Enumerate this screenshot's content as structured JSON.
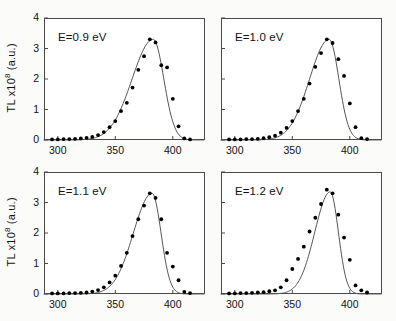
{
  "figure": {
    "background": "#fbfbfa",
    "panel_background": "#ffffff",
    "frame_color": "#4a4a4a",
    "marker_color": "#000000",
    "curve_color": "#555555",
    "ylabel_prefix": "TL x10",
    "ylabel_exponent": "8",
    "ylabel_suffix": " (a.u.)"
  },
  "chart_data": [
    {
      "type": "scatter",
      "panel": "top-left",
      "title": "",
      "annotation": "E=0.9 eV",
      "xlabel": "",
      "ylabel": "TL x10^8 (a.u.)",
      "xlim": [
        288,
        428
      ],
      "ylim": [
        0,
        4
      ],
      "xticks": [
        300,
        350,
        400
      ],
      "yticks": [
        0,
        1,
        2,
        3,
        4
      ],
      "grid": false,
      "legend": "none",
      "x": [
        295,
        300,
        305,
        310,
        315,
        320,
        325,
        330,
        335,
        340,
        345,
        350,
        355,
        360,
        365,
        370,
        375,
        380,
        385,
        390,
        395,
        400,
        405,
        410,
        415
      ],
      "values": [
        0.02,
        0.02,
        0.03,
        0.03,
        0.04,
        0.05,
        0.07,
        0.1,
        0.16,
        0.26,
        0.42,
        0.62,
        0.95,
        1.22,
        1.72,
        2.3,
        2.75,
        3.3,
        3.2,
        2.45,
        2.38,
        1.35,
        0.45,
        0.05,
        0.02
      ],
      "fit_curve": {
        "model": "first-order TL glow peak",
        "peak_x": 383,
        "peak_y": 3.3,
        "rise_width": 26,
        "fall_width": 13
      }
    },
    {
      "type": "scatter",
      "panel": "top-right",
      "title": "",
      "annotation": "E=1.0 eV",
      "xlabel": "",
      "ylabel": "",
      "xlim": [
        288,
        428
      ],
      "ylim": [
        0,
        4
      ],
      "xticks": [
        300,
        350,
        400
      ],
      "yticks": [
        0,
        1,
        2,
        3,
        4
      ],
      "grid": false,
      "legend": "none",
      "x": [
        295,
        300,
        305,
        310,
        315,
        320,
        325,
        330,
        335,
        340,
        345,
        350,
        355,
        360,
        365,
        370,
        375,
        380,
        385,
        390,
        395,
        400,
        405,
        410,
        415
      ],
      "values": [
        0.02,
        0.02,
        0.02,
        0.03,
        0.03,
        0.04,
        0.06,
        0.09,
        0.14,
        0.24,
        0.4,
        0.62,
        0.95,
        1.35,
        1.85,
        2.4,
        2.85,
        3.3,
        3.18,
        2.65,
        2.1,
        1.2,
        0.42,
        0.06,
        0.03
      ],
      "fit_curve": {
        "model": "first-order TL glow peak",
        "peak_x": 382,
        "peak_y": 3.3,
        "rise_width": 24,
        "fall_width": 12
      }
    },
    {
      "type": "scatter",
      "panel": "bottom-left",
      "title": "",
      "annotation": "E=1.1 eV",
      "xlabel": "",
      "ylabel": "TL x10^8 (a.u.)",
      "xlim": [
        288,
        428
      ],
      "ylim": [
        0,
        4
      ],
      "xticks": [
        300,
        350,
        400
      ],
      "yticks": [
        0,
        1,
        2,
        3,
        4
      ],
      "grid": false,
      "legend": "none",
      "x": [
        295,
        300,
        305,
        310,
        315,
        320,
        325,
        330,
        335,
        340,
        345,
        350,
        355,
        360,
        365,
        370,
        375,
        380,
        385,
        390,
        395,
        400,
        405,
        410,
        415
      ],
      "values": [
        0.02,
        0.02,
        0.02,
        0.03,
        0.03,
        0.04,
        0.05,
        0.08,
        0.13,
        0.22,
        0.38,
        0.6,
        0.92,
        1.35,
        1.9,
        2.45,
        2.9,
        3.3,
        3.15,
        2.45,
        1.35,
        0.9,
        0.45,
        0.07,
        0.03
      ],
      "fit_curve": {
        "model": "first-order TL glow peak",
        "peak_x": 382,
        "peak_y": 3.3,
        "rise_width": 23,
        "fall_width": 11
      }
    },
    {
      "type": "scatter",
      "panel": "bottom-right",
      "title": "",
      "annotation": "E=1.2 eV",
      "xlabel": "",
      "ylabel": "",
      "xlim": [
        288,
        428
      ],
      "ylim": [
        0,
        4
      ],
      "xticks": [
        300,
        350,
        400
      ],
      "yticks": [
        0,
        1,
        2,
        3,
        4
      ],
      "grid": false,
      "legend": "none",
      "x": [
        295,
        300,
        305,
        310,
        315,
        320,
        325,
        330,
        335,
        340,
        345,
        350,
        355,
        360,
        365,
        370,
        375,
        380,
        385,
        390,
        395,
        400,
        405,
        410,
        415
      ],
      "values": [
        0.02,
        0.02,
        0.03,
        0.03,
        0.04,
        0.05,
        0.06,
        0.09,
        0.12,
        0.22,
        0.45,
        0.82,
        1.15,
        1.55,
        2.05,
        2.5,
        2.95,
        3.42,
        3.3,
        2.6,
        1.85,
        1.12,
        0.28,
        0.12,
        0.05
      ],
      "fit_curve": {
        "model": "first-order TL glow peak",
        "peak_x": 383,
        "peak_y": 3.35,
        "rise_width": 19,
        "fall_width": 10
      }
    }
  ]
}
